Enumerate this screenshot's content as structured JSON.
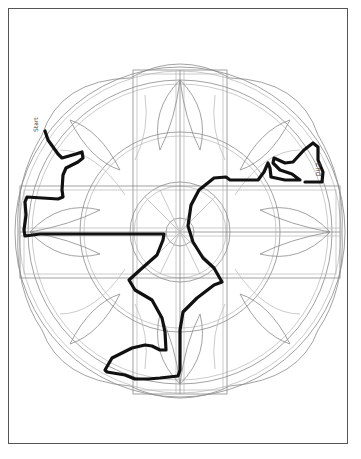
{
  "puzzle": {
    "type": "maze",
    "style": "circular mandala maze with art-nouveau leaf motifs",
    "start_label": "Start",
    "end_label": "End",
    "colors": {
      "background": "#ffffff",
      "frame": "#555555",
      "maze_lines": "#8a8a8a",
      "solution_path": "#111111"
    }
  }
}
